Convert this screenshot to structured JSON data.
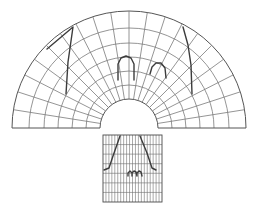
{
  "diagram": {
    "colors": {
      "background": "#ffffff",
      "grid": "#7a7a7a",
      "outline": "#555555",
      "feature": "#3c3c3c"
    },
    "polar_grid": {
      "center": [
        129,
        128
      ],
      "outer_radius": 117,
      "inner_radius": 29,
      "ring_radii": [
        29,
        43,
        57,
        71,
        85,
        100,
        117
      ],
      "sectors": 20,
      "start_angle_deg": 180,
      "end_angle_deg": 0,
      "features": [
        {
          "name": "left-zigzag",
          "points": [
            [
              47,
              49
            ],
            [
              73,
              27
            ],
            [
              68,
              62
            ],
            [
              66,
              94
            ]
          ]
        },
        {
          "name": "right-curve",
          "points": [
            [
              183,
              27
            ],
            [
              188,
              45
            ],
            [
              191,
              65
            ],
            [
              192,
              94
            ]
          ]
        },
        {
          "name": "center-arch",
          "points": [
            [
              118,
              80
            ],
            [
              118,
              64
            ],
            [
              121,
              58
            ],
            [
              126,
              56
            ],
            [
              131,
              58
            ],
            [
              134,
              64
            ],
            [
              134,
              80
            ]
          ]
        },
        {
          "name": "right-arch",
          "points": [
            [
              150,
              74
            ],
            [
              152,
              67
            ],
            [
              156,
              63
            ],
            [
              161,
              63
            ],
            [
              165,
              68
            ],
            [
              166,
              78
            ]
          ]
        }
      ]
    },
    "rect_grid": {
      "x": 103,
      "y": 135,
      "width": 59,
      "height": 67,
      "columns": 20,
      "rows": 7,
      "features": [
        {
          "name": "left-edge-line",
          "points": [
            [
              120,
              136
            ],
            [
              113,
              156
            ],
            [
              109,
              168
            ],
            [
              104,
              170
            ]
          ]
        },
        {
          "name": "right-edge-line",
          "points": [
            [
              140,
              136
            ],
            [
              147,
              153
            ],
            [
              152,
              168
            ],
            [
              156,
              170
            ]
          ]
        },
        {
          "name": "bottom-arches",
          "points": [
            [
              128,
              176
            ],
            [
              128,
              173
            ],
            [
              130,
              171
            ],
            [
              132,
              173
            ],
            [
              132,
              176
            ],
            [
              132,
              173
            ],
            [
              134,
              171
            ],
            [
              136,
              172
            ],
            [
              137,
              176
            ],
            [
              137,
              173
            ],
            [
              139,
              171
            ],
            [
              141,
              172
            ],
            [
              142,
              176
            ]
          ]
        }
      ]
    }
  }
}
